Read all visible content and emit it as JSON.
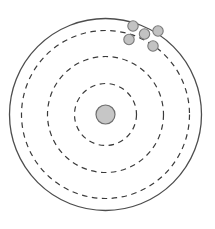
{
  "figure": {
    "title": "",
    "canvas": {
      "width": 215,
      "height": 229,
      "background": "#ffffff"
    }
  },
  "chart_data": {
    "type": "scatter",
    "title": "",
    "subtitle": "",
    "xlabel": "",
    "ylabel": "",
    "grid": false,
    "legend": null,
    "center": {
      "x": 105.5,
      "y": 114.5
    },
    "rings": [
      {
        "name": "ring-outer",
        "radius": 96,
        "style": "solid",
        "stroke": "#4d4d4d",
        "stroke_width": 1.3
      },
      {
        "name": "ring-3",
        "radius": 84,
        "style": "dashed",
        "stroke": "#3a3a3a",
        "stroke_width": 1.2
      },
      {
        "name": "ring-2",
        "radius": 58,
        "style": "dashed",
        "stroke": "#3a3a3a",
        "stroke_width": 1.2
      },
      {
        "name": "ring-1",
        "radius": 31,
        "style": "dashed",
        "stroke": "#3a3a3a",
        "stroke_width": 1.2
      }
    ],
    "center_marker": {
      "name": "bullseye-center",
      "x": 105.5,
      "y": 114.5,
      "radius": 9.5,
      "fill": "#c6c6c6",
      "stroke": "#6e6e6e",
      "stroke_width": 1.2
    },
    "points": [
      {
        "id": 1,
        "x": 133,
        "y": 26,
        "r": 5.2
      },
      {
        "id": 2,
        "x": 144.5,
        "y": 34,
        "r": 5.2
      },
      {
        "id": 3,
        "x": 158,
        "y": 31,
        "r": 5.2
      },
      {
        "id": 4,
        "x": 129,
        "y": 39.5,
        "r": 5.2
      },
      {
        "id": 5,
        "x": 153,
        "y": 46,
        "r": 5.2
      }
    ],
    "point_style": {
      "fill": "#c2c2c2",
      "stroke": "#7a7a7a",
      "stroke_width": 1.1
    },
    "xlim": [
      0,
      215
    ],
    "ylim": [
      229,
      0
    ]
  }
}
